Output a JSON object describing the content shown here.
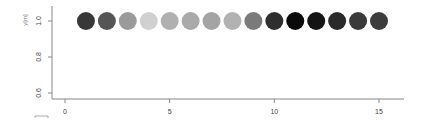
{
  "chart_data": {
    "type": "scatter",
    "title": "",
    "xlabel": "",
    "ylabel": "y[m]",
    "x": [
      1,
      2,
      3,
      4,
      5,
      6,
      7,
      8,
      9,
      10,
      11,
      12,
      13,
      14,
      15
    ],
    "y": [
      1.0,
      1.0,
      1.0,
      1.0,
      1.0,
      1.0,
      1.0,
      1.0,
      1.0,
      1.0,
      1.0,
      1.0,
      1.0,
      1.0,
      1.0
    ],
    "point_colors": [
      "#383838",
      "#555555",
      "#9a9a9a",
      "#d0d0d0",
      "#b0b0b0",
      "#aaaaaa",
      "#a4a4a4",
      "#b2b2b2",
      "#7a7a7a",
      "#2e2e2e",
      "#0a0a0a",
      "#141414",
      "#2a2a2a",
      "#3a3a3a",
      "#3c3c3c"
    ],
    "marker": "filled-circle",
    "xlim": [
      -0.6,
      16.2
    ],
    "ylim": [
      0.57,
      1.08
    ],
    "x_ticks": [
      0,
      5,
      10,
      15
    ],
    "x_tick_labels": [
      "0",
      "5",
      "10",
      "15"
    ],
    "y_ticks": [
      0.6,
      0.8,
      1.0
    ],
    "y_tick_labels": [
      "0.6",
      "0.8",
      "1.0"
    ],
    "grid": false,
    "legend": null
  }
}
